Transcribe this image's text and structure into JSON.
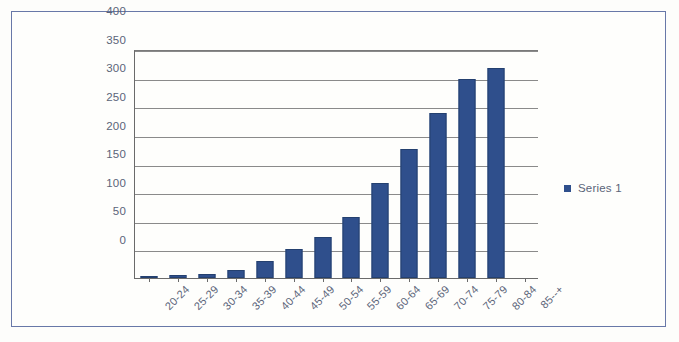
{
  "chart_data": {
    "type": "bar",
    "title": "",
    "subtitle": "",
    "xlabel": "",
    "ylabel": "",
    "categories": [
      "20-24",
      "25-29",
      "30-34",
      "35-39",
      "40-44",
      "45-49",
      "50-54",
      "55-59",
      "60-64",
      "65-69",
      "70-74",
      "75-79",
      "80-84",
      "85--+"
    ],
    "series": [
      {
        "name": "Series 1",
        "color": "#2f4f8c",
        "values": [
          4,
          5,
          7,
          14,
          30,
          50,
          72,
          107,
          166,
          225,
          288,
          347,
          367,
          0
        ]
      }
    ],
    "values": [
      4,
      5,
      7,
      14,
      30,
      50,
      72,
      107,
      166,
      225,
      288,
      347,
      367,
      0
    ],
    "ylim": [
      0,
      400
    ],
    "ytick_step": 50,
    "ytick_labels": [
      "400",
      "350",
      "300",
      "250",
      "200",
      "150",
      "100",
      "50",
      "0"
    ],
    "grid": "horizontal",
    "legend_position": "right"
  },
  "legend": {
    "entries": [
      {
        "label": "Series 1",
        "marker": "square-marker",
        "color": "#2f4f8c"
      }
    ]
  },
  "colors": {
    "bar": "#2f4f8c",
    "bar_border": "#24406f",
    "frame": "#6878a8",
    "axis": "#6a6a6a",
    "grid": "#8a8a8a",
    "text": "#5b6479",
    "background": "#fefefc"
  }
}
